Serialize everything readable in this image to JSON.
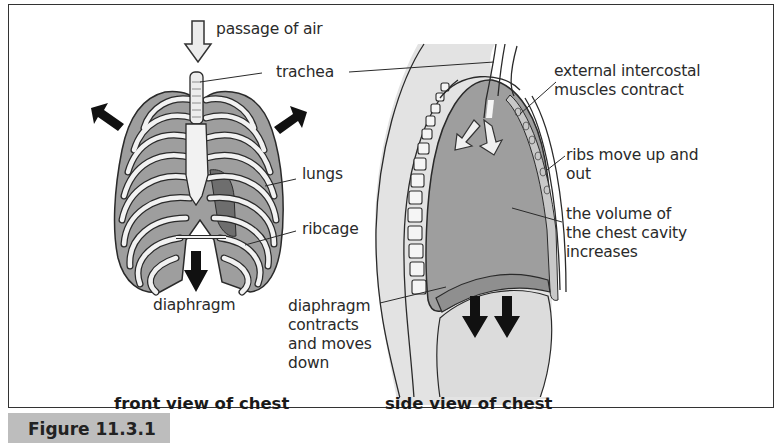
{
  "figure": {
    "number_label": "Figure 11.3.1",
    "colors": {
      "lung_fill": "#9e9e9e",
      "rib_fill": "#f2f2f2",
      "outline": "#2a2a2a",
      "arrow_black": "#111111",
      "tissue_fill": "#e3e3e3",
      "tab_fill": "#bdbdbd"
    }
  },
  "front_view": {
    "caption": "front view of chest",
    "labels": {
      "passage_of_air": "passage of air",
      "trachea": "trachea",
      "lungs": "lungs",
      "ribcage": "ribcage",
      "diaphragm": "diaphragm"
    },
    "icons": [
      "passage-of-air-arrow-icon",
      "ribcage-expand-left-arrow-icon",
      "ribcage-expand-right-arrow-icon",
      "diaphragm-down-arrow-icon"
    ]
  },
  "side_view": {
    "caption": "side view of chest",
    "labels": {
      "external_intercostal": "external intercostal\nmuscles contract",
      "ribs_move": "ribs move up and\nout",
      "volume": "the volume of\nthe chest cavity\nincreases",
      "diaphragm_contracts": "diaphragm\ncontracts\nand moves\ndown"
    },
    "icons": [
      "air-inflow-arrows-icon",
      "diaphragm-down-arrows-icon"
    ]
  }
}
